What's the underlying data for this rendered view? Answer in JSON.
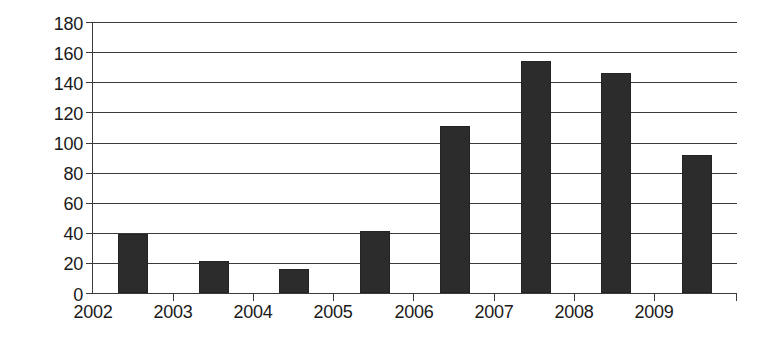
{
  "chart_data": {
    "type": "bar",
    "title": "",
    "subtitle": "",
    "xlabel": "",
    "ylabel": "",
    "categories": [
      "2002",
      "2003",
      "2004",
      "2005",
      "2006",
      "2007",
      "2008",
      "2009"
    ],
    "values": [
      39,
      21,
      16,
      41,
      111,
      154,
      146,
      92
    ],
    "ylim": [
      0,
      180
    ],
    "y_ticks": [
      0,
      20,
      40,
      60,
      80,
      100,
      120,
      140,
      160,
      180
    ],
    "y_tick_labels": [
      "0",
      "20",
      "40",
      "60",
      "80",
      "100",
      "120",
      "140",
      "160",
      "180"
    ],
    "grid": "horizontal",
    "legend": "none",
    "annotations": [],
    "colors": {
      "bar_fill": "#2c2c2c",
      "axis": "#3b3b3b",
      "grid": "#3b3b3b",
      "background": "#ffffff",
      "text": "#1a1a1a"
    }
  }
}
